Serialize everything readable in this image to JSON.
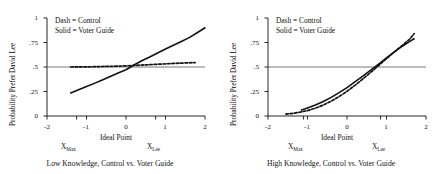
{
  "figure": {
    "background": "#ffffff",
    "ink": "#111111",
    "panel_count": 2
  },
  "chart_data": [
    {
      "type": "line",
      "panel": "left",
      "title": "",
      "caption": "Low Knowledge, Control vs. Voter Guide",
      "xlabel": "Ideal Point",
      "ylabel": "Probability Prefer David Lee",
      "xlim": [
        -2,
        2
      ],
      "ylim": [
        0,
        1
      ],
      "grid": false,
      "legend_position": "top-left",
      "xticks": [
        -2,
        -1,
        0,
        1,
        2
      ],
      "xticklabels": [
        "-2",
        "-1",
        "0",
        "1",
        "2"
      ],
      "yticks": [
        0,
        0.25,
        0.5,
        0.75,
        1
      ],
      "yticklabels": [
        "0",
        ".25",
        ".5",
        ".75",
        "1"
      ],
      "reference_line_y": 0.5,
      "annotations": [
        {
          "label": "X",
          "sub": "Max",
          "x": -1.25
        },
        {
          "label": "X",
          "sub": "Lee",
          "x": 0.75
        }
      ],
      "legend": [
        {
          "entry": "Dash = Control",
          "style": "dashed"
        },
        {
          "entry": "Solid = Voter Guide",
          "style": "solid"
        }
      ],
      "series": [
        {
          "name": "Voter Guide",
          "style": "solid",
          "x": [
            -1.4,
            -1.2,
            -1.0,
            -0.8,
            -0.6,
            -0.4,
            -0.2,
            0.0,
            0.2,
            0.4,
            0.6,
            0.8,
            1.0,
            1.2,
            1.4,
            1.6,
            1.8,
            2.0
          ],
          "y": [
            0.235,
            0.268,
            0.3,
            0.333,
            0.368,
            0.403,
            0.438,
            0.472,
            0.52,
            0.563,
            0.603,
            0.643,
            0.683,
            0.722,
            0.76,
            0.8,
            0.85,
            0.9
          ]
        },
        {
          "name": "Control",
          "style": "dashed",
          "x": [
            -1.4,
            -1.2,
            -1.0,
            -0.8,
            -0.6,
            -0.4,
            -0.2,
            0.0,
            0.2,
            0.4,
            0.6,
            0.8,
            1.0,
            1.2,
            1.4,
            1.6,
            1.75
          ],
          "y": [
            0.5,
            0.501,
            0.502,
            0.503,
            0.505,
            0.507,
            0.509,
            0.512,
            0.516,
            0.52,
            0.524,
            0.528,
            0.532,
            0.536,
            0.54,
            0.543,
            0.545
          ]
        }
      ]
    },
    {
      "type": "line",
      "panel": "right",
      "title": "",
      "caption": "High Knowledge, Control vs. Voter Guide",
      "xlabel": "Ideal Point",
      "ylabel": "Probability Prefer David Lee",
      "xlim": [
        -2,
        2
      ],
      "ylim": [
        0,
        1
      ],
      "grid": false,
      "legend_position": "top-left",
      "xticks": [
        -2,
        -1,
        0,
        1,
        2
      ],
      "xticklabels": [
        "-2",
        "-1",
        "0",
        "1",
        "2"
      ],
      "yticks": [
        0,
        0.25,
        0.5,
        0.75,
        1
      ],
      "yticklabels": [
        "0",
        ".25",
        ".5",
        ".75",
        "1"
      ],
      "reference_line_y": 0.5,
      "annotations": [
        {
          "label": "X",
          "sub": "Max",
          "x": -1.1
        },
        {
          "label": "X",
          "sub": "Lee",
          "x": 0.85
        }
      ],
      "legend": [
        {
          "entry": "Dash = Control",
          "style": "dashed"
        },
        {
          "entry": "Solid = Voter Guide",
          "style": "solid"
        }
      ],
      "series": [
        {
          "name": "Voter Guide",
          "style": "solid",
          "x": [
            -1.15,
            -1.0,
            -0.8,
            -0.6,
            -0.4,
            -0.2,
            0.0,
            0.2,
            0.4,
            0.6,
            0.8,
            1.0,
            1.2,
            1.4,
            1.6,
            1.7
          ],
          "y": [
            0.06,
            0.082,
            0.112,
            0.148,
            0.19,
            0.238,
            0.29,
            0.348,
            0.408,
            0.468,
            0.53,
            0.594,
            0.655,
            0.712,
            0.764,
            0.788
          ]
        },
        {
          "name": "Control",
          "style": "dashed",
          "x": [
            -1.55,
            -1.4,
            -1.2,
            -1.0,
            -0.8,
            -0.6,
            -0.4,
            -0.2,
            0.0,
            0.2,
            0.4,
            0.6,
            0.8,
            1.0,
            1.2,
            1.4,
            1.6,
            1.7
          ],
          "y": [
            0.02,
            0.025,
            0.038,
            0.055,
            0.08,
            0.112,
            0.152,
            0.198,
            0.252,
            0.312,
            0.378,
            0.445,
            0.515,
            0.585,
            0.655,
            0.72,
            0.79,
            0.84
          ]
        }
      ]
    }
  ]
}
